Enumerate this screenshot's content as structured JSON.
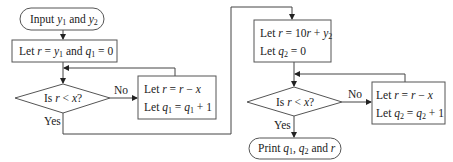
{
  "flowchart": {
    "nodes": {
      "input": {
        "type": "terminator",
        "parts": [
          "Input ",
          "y",
          "1",
          " and ",
          "y",
          "2"
        ]
      },
      "init1": {
        "type": "process",
        "parts": [
          "Let ",
          "r",
          " = ",
          "y",
          "1",
          " and ",
          "q",
          "1",
          " = 0"
        ]
      },
      "decision1": {
        "type": "decision",
        "text": "Is r < x?"
      },
      "loop1": {
        "type": "process",
        "lines": [
          "Let r = r − x",
          "Let q1 = q1 + 1"
        ]
      },
      "init2": {
        "type": "process",
        "lines": [
          "Let r = 10r + y2",
          "Let q2 = 0"
        ]
      },
      "decision2": {
        "type": "decision",
        "text": "Is r < x?"
      },
      "loop2": {
        "type": "process",
        "lines": [
          "Let r = r − x",
          "Let q2 = q2 + 1"
        ]
      },
      "output": {
        "type": "terminator",
        "text": "Print q1, q2 and r"
      }
    },
    "edge_labels": {
      "d1_no": "No",
      "d1_yes": "Yes",
      "d2_no": "No",
      "d2_yes": "Yes"
    },
    "text": {
      "let": "Let ",
      "is": "Is ",
      "and": " and ",
      "print": "Print ",
      "input": "Input ",
      "r": "r",
      "x": "x",
      "y": "y",
      "q": "q",
      "one": "1",
      "two": "2",
      "eq": " = ",
      "lt": " < ",
      "qmark": "?",
      "minus": " − ",
      "plus1": " + 1",
      "eq0": " = 0",
      "ten": "10",
      "plus": " + ",
      "comma": ", "
    }
  }
}
